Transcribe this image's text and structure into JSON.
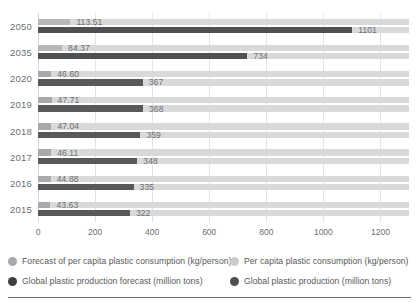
{
  "chart_data": {
    "type": "bar",
    "orientation": "horizontal",
    "title": "",
    "xlabel": "",
    "ylabel": "",
    "categories": [
      "2050",
      "2035",
      "2020",
      "2019",
      "2018",
      "2017",
      "2016",
      "2015"
    ],
    "xlim": [
      0,
      1300
    ],
    "xticks": [
      "0",
      "200",
      "400",
      "600",
      "800",
      "1000",
      "1200"
    ],
    "xtick_values": [
      0,
      200,
      400,
      600,
      800,
      1000,
      1200
    ],
    "grid": true,
    "legend_position": "bottom",
    "series": [
      {
        "name": "Forecast of per capita plastic consumption (kg/person)",
        "color": "#a7a9ac",
        "unit": "kg/person",
        "values": [
          113.51,
          84.37,
          null,
          null,
          null,
          null,
          null,
          null
        ],
        "labels": [
          "113.51",
          "84.37",
          "",
          "",
          "",
          "",
          "",
          ""
        ]
      },
      {
        "name": "Per capita plastic consumption (kg/person)",
        "color": "#cbcccd",
        "unit": "kg/person",
        "values": [
          null,
          null,
          46.6,
          47.71,
          47.04,
          46.11,
          44.88,
          43.63
        ],
        "labels": [
          "",
          "",
          "46.60",
          "47.71",
          "47.04",
          "46.11",
          "44.88",
          "43.63"
        ]
      },
      {
        "name": "Global plastic production forecast (million tons)",
        "color": "#4f5052",
        "unit": "million tons",
        "values": [
          1101,
          734,
          null,
          null,
          null,
          null,
          null,
          null
        ],
        "labels": [
          "1101",
          "734",
          "",
          "",
          "",
          "",
          "",
          ""
        ]
      },
      {
        "name": "Global plastic production (million tons)",
        "color": "#404041",
        "unit": "million tons",
        "values": [
          null,
          null,
          367,
          368,
          359,
          348,
          335,
          322
        ],
        "labels": [
          "",
          "",
          "367",
          "368",
          "359",
          "348",
          "335",
          "322"
        ]
      }
    ],
    "rows": [
      {
        "category": "2050",
        "consumption": 113.51,
        "consumption_label": "113.51",
        "production": 1101,
        "production_label": "1101",
        "forecast": true
      },
      {
        "category": "2035",
        "consumption": 84.37,
        "consumption_label": "84.37",
        "production": 734,
        "production_label": "734",
        "forecast": true
      },
      {
        "category": "2020",
        "consumption": 46.6,
        "consumption_label": "46.60",
        "production": 367,
        "production_label": "367",
        "forecast": false
      },
      {
        "category": "2019",
        "consumption": 47.71,
        "consumption_label": "47.71",
        "production": 368,
        "production_label": "368",
        "forecast": false
      },
      {
        "category": "2018",
        "consumption": 47.04,
        "consumption_label": "47.04",
        "production": 359,
        "production_label": "359",
        "forecast": false
      },
      {
        "category": "2017",
        "consumption": 46.11,
        "consumption_label": "46.11",
        "production": 348,
        "production_label": "348",
        "forecast": false
      },
      {
        "category": "2016",
        "consumption": 44.88,
        "consumption_label": "44.88",
        "production": 335,
        "production_label": "335",
        "forecast": false
      },
      {
        "category": "2015",
        "consumption": 43.63,
        "consumption_label": "43.63",
        "production": 322,
        "production_label": "322",
        "forecast": false
      }
    ]
  },
  "legend": {
    "items": [
      {
        "label": "Forecast of per capita plastic consumption (kg/person)",
        "color": "#a7a9ac"
      },
      {
        "label": "Per capita plastic consumption (kg/person)",
        "color": "#cbcccd"
      },
      {
        "label": "Global plastic production forecast (million tons)",
        "color": "#404041"
      },
      {
        "label": "Global plastic production (million tons)",
        "color": "#4f5052"
      }
    ]
  }
}
